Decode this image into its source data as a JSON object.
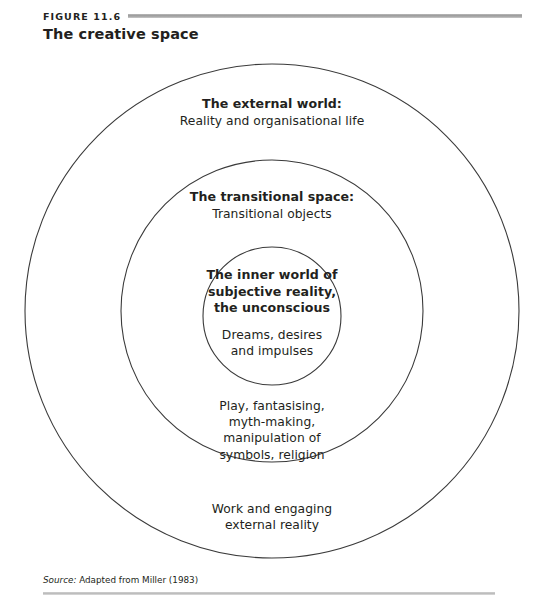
{
  "figure": {
    "label": "FIGURE 11.6",
    "title": "The creative space"
  },
  "diagram": {
    "type": "concentric-circles",
    "layers": [
      {
        "id": "outer",
        "name": "external-world",
        "heading": "The external world:",
        "subtitle": "Reality and organisational life",
        "lower_lines": [
          "Work and engaging",
          "external reality"
        ]
      },
      {
        "id": "middle",
        "name": "transitional-space",
        "heading": "The transitional space:",
        "subtitle": "Transitional objects",
        "lower_lines": [
          "Play, fantasising,",
          "myth-making,",
          "manipulation of",
          "symbols, religion"
        ]
      },
      {
        "id": "inner",
        "name": "inner-world",
        "heading_lines": [
          "The inner world of",
          "subjective reality,",
          "the unconscious"
        ],
        "sub_lines": [
          "Dreams, desires",
          "and impulses"
        ]
      }
    ],
    "outer_heading": "The external world:",
    "outer_subtitle": "Reality and organisational life",
    "outer_lower_line1": "Work and engaging",
    "outer_lower_line2": "external reality",
    "middle_heading": "The transitional space:",
    "middle_subtitle": "Transitional objects",
    "middle_lower_line1": "Play, fantasising,",
    "middle_lower_line2": "myth-making,",
    "middle_lower_line3": "manipulation of",
    "middle_lower_line4": "symbols, religion",
    "inner_heading_line1": "The inner world of",
    "inner_heading_line2": "subjective reality,",
    "inner_heading_line3": "the unconscious",
    "inner_sub_line1": "Dreams, desires",
    "inner_sub_line2": "and impulses"
  },
  "source": {
    "prefix": "Source:",
    "text": " Adapted from Miller (1983)"
  },
  "colors": {
    "ink": "#231f20",
    "stroke": "#3a3a3a",
    "rule": "#a9a9a9",
    "background": "#ffffff"
  }
}
